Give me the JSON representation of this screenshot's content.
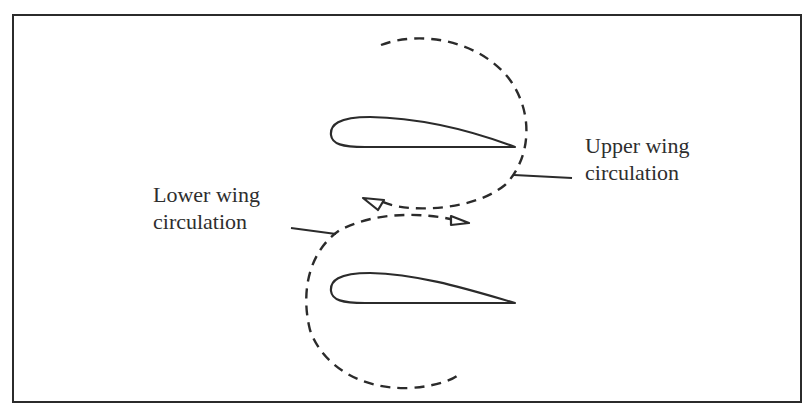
{
  "diagram": {
    "type": "biplane-wing-circulation",
    "stroke_color": "#2b2b2b",
    "labels": {
      "upper": {
        "line1": "Upper wing",
        "line2": "circulation"
      },
      "lower": {
        "line1": "Lower wing",
        "line2": "circulation"
      }
    },
    "elements": [
      {
        "name": "upper-airfoil",
        "shape": "airfoil"
      },
      {
        "name": "lower-airfoil",
        "shape": "airfoil"
      },
      {
        "name": "upper-circulation",
        "shape": "dashed-loop"
      },
      {
        "name": "lower-circulation",
        "shape": "dashed-loop"
      },
      {
        "name": "arrowhead-left",
        "shape": "open-triangle"
      },
      {
        "name": "arrowhead-right",
        "shape": "open-triangle"
      }
    ]
  }
}
